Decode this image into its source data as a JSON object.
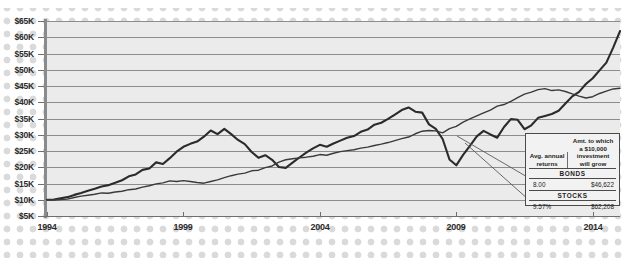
{
  "chart_data": {
    "type": "line",
    "title": "",
    "xlabel": "",
    "ylabel": "",
    "xlim": [
      1994,
      2015
    ],
    "ylim": [
      5000,
      65000
    ],
    "grid": true,
    "legend_position": "inside-bottom-right",
    "y_ticks": [
      "$5K",
      "$10K",
      "$15K",
      "$20K",
      "$25K",
      "$30K",
      "$35K",
      "$40K",
      "$45K",
      "$50K",
      "$55K",
      "$60K",
      "$65K"
    ],
    "y_tick_values": [
      5000,
      10000,
      15000,
      20000,
      25000,
      30000,
      35000,
      40000,
      45000,
      50000,
      55000,
      60000,
      65000
    ],
    "x_ticks": [
      "1994",
      "1999",
      "2004",
      "2009",
      "2014"
    ],
    "x_tick_values": [
      1994,
      1999,
      2004,
      2009,
      2014
    ],
    "series": [
      {
        "name": "STOCKS",
        "color": "#2b2b2b",
        "width": 2.1,
        "x": [
          1994.0,
          1994.25,
          1994.5,
          1994.75,
          1995.0,
          1995.25,
          1995.5,
          1995.75,
          1996.0,
          1996.25,
          1996.5,
          1996.75,
          1997.0,
          1997.25,
          1997.5,
          1997.75,
          1998.0,
          1998.25,
          1998.5,
          1998.75,
          1999.0,
          1999.25,
          1999.5,
          1999.75,
          2000.0,
          2000.25,
          2000.5,
          2000.75,
          2001.0,
          2001.25,
          2001.5,
          2001.75,
          2002.0,
          2002.25,
          2002.5,
          2002.75,
          2003.0,
          2003.25,
          2003.5,
          2003.75,
          2004.0,
          2004.25,
          2004.5,
          2004.75,
          2005.0,
          2005.25,
          2005.5,
          2005.75,
          2006.0,
          2006.25,
          2006.5,
          2006.75,
          2007.0,
          2007.25,
          2007.5,
          2007.75,
          2008.0,
          2008.25,
          2008.5,
          2008.75,
          2009.0,
          2009.25,
          2009.5,
          2009.75,
          2010.0,
          2010.25,
          2010.5,
          2010.75,
          2011.0,
          2011.25,
          2011.5,
          2011.75,
          2012.0,
          2012.25,
          2012.5,
          2012.75,
          2013.0,
          2013.25,
          2013.5,
          2013.75,
          2014.0,
          2014.25,
          2014.5,
          2014.75,
          2015.0
        ],
        "y": [
          10000,
          10100,
          10450,
          10800,
          11500,
          12100,
          12800,
          13400,
          14100,
          14500,
          15200,
          16000,
          17200,
          17800,
          19200,
          19600,
          21500,
          21000,
          22800,
          24800,
          26300,
          27200,
          27900,
          29400,
          31300,
          30200,
          31800,
          30200,
          28400,
          27100,
          24700,
          22900,
          23700,
          22300,
          20100,
          19800,
          21400,
          23000,
          24500,
          25800,
          26900,
          26300,
          27300,
          28200,
          29100,
          29600,
          30900,
          31600,
          33100,
          33700,
          34900,
          36200,
          37600,
          38400,
          37100,
          36800,
          33200,
          31800,
          28700,
          22400,
          20600,
          23800,
          26600,
          29500,
          31200,
          30100,
          29100,
          32400,
          34800,
          34600,
          31700,
          32900,
          35200,
          35800,
          36400,
          37400,
          39600,
          41800,
          43200,
          45600,
          47400,
          49800,
          52200,
          56800,
          61900
        ]
      },
      {
        "name": "BONDS",
        "color": "#3a3a3a",
        "width": 1.4,
        "x": [
          1994.0,
          1994.25,
          1994.5,
          1994.75,
          1995.0,
          1995.25,
          1995.5,
          1995.75,
          1996.0,
          1996.25,
          1996.5,
          1996.75,
          1997.0,
          1997.25,
          1997.5,
          1997.75,
          1998.0,
          1998.25,
          1998.5,
          1998.75,
          1999.0,
          1999.25,
          1999.5,
          1999.75,
          2000.0,
          2000.25,
          2000.5,
          2000.75,
          2001.0,
          2001.25,
          2001.5,
          2001.75,
          2002.0,
          2002.25,
          2002.5,
          2002.75,
          2003.0,
          2003.25,
          2003.5,
          2003.75,
          2004.0,
          2004.25,
          2004.5,
          2004.75,
          2005.0,
          2005.25,
          2005.5,
          2005.75,
          2006.0,
          2006.25,
          2006.5,
          2006.75,
          2007.0,
          2007.25,
          2007.5,
          2007.75,
          2008.0,
          2008.25,
          2008.5,
          2008.75,
          2009.0,
          2009.25,
          2009.5,
          2009.75,
          2010.0,
          2010.25,
          2010.5,
          2010.75,
          2011.0,
          2011.25,
          2011.5,
          2011.75,
          2012.0,
          2012.25,
          2012.5,
          2012.75,
          2013.0,
          2013.25,
          2013.5,
          2013.75,
          2014.0,
          2014.25,
          2014.5,
          2014.75,
          2015.0
        ],
        "y": [
          10000,
          9900,
          10050,
          10200,
          10700,
          11100,
          11400,
          11700,
          12100,
          12000,
          12400,
          12600,
          13100,
          13300,
          13900,
          14300,
          14900,
          15200,
          15800,
          15600,
          15900,
          15600,
          15300,
          15100,
          15600,
          16100,
          16800,
          17400,
          17900,
          18200,
          18900,
          19100,
          19900,
          20400,
          21600,
          22300,
          22600,
          22900,
          23100,
          23400,
          23900,
          23700,
          24300,
          24800,
          25100,
          25400,
          25900,
          26200,
          26700,
          27100,
          27600,
          28200,
          28800,
          29300,
          30300,
          31100,
          31300,
          31200,
          30600,
          31900,
          32600,
          33900,
          34900,
          35800,
          36700,
          37600,
          38800,
          39300,
          40300,
          41400,
          42500,
          43100,
          43900,
          44200,
          43600,
          43800,
          43300,
          42600,
          41900,
          41300,
          41700,
          42700,
          43400,
          44100,
          44300
        ]
      }
    ],
    "callouts": [
      {
        "series": "BONDS",
        "avg_annual_return": "8.00",
        "growth_of_10000": "$46,622"
      },
      {
        "series": "STOCKS",
        "avg_annual_return": "9.57%",
        "growth_of_10000": "$62,208"
      }
    ]
  },
  "legend": {
    "header_col1": "Avg. annual\nreturns",
    "header_col1_line1": "Avg. annual",
    "header_col1_line2": "returns",
    "header_col2_line1": "Amt. to which",
    "header_col2_line2": "a $10,000",
    "header_col2_line3": "investment",
    "header_col2_line4": "will grow",
    "bonds_title": "BONDS",
    "bonds_return": "8.00",
    "bonds_growth": "$46,622",
    "stocks_title": "STOCKS",
    "stocks_return": "9.57%",
    "stocks_growth": "$62,208"
  }
}
